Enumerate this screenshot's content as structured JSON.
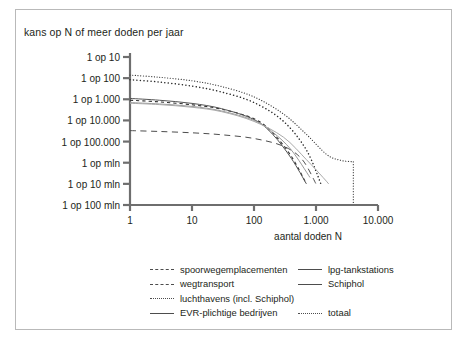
{
  "figure": {
    "title": "kans op N of meer doden per jaar",
    "frame_color": "#b9b9b9",
    "line_color": "#4d4d4d",
    "axis_color": "#6e6e6e"
  },
  "chart_data": {
    "type": "line",
    "title": "kans op N of meer doden per jaar",
    "xlabel": "aantal doden  N",
    "ylabel": "kans op N of meer doden per jaar",
    "xscale": "log",
    "yscale": "log",
    "xlim": [
      1,
      10000
    ],
    "ylim": [
      1e-08,
      0.1
    ],
    "grid": false,
    "legend_position": "below",
    "xticks": [
      1,
      10,
      100,
      1000,
      10000
    ],
    "xticklabels": [
      "1",
      "10",
      "100",
      "1.000",
      "10.000"
    ],
    "yticks": [
      0.1,
      0.01,
      0.001,
      0.0001,
      1e-05,
      1e-06,
      1e-07,
      1e-08
    ],
    "yticklabels": [
      "1 op 10",
      "1 op 100",
      "1 op 1.000",
      "1 op 10.000",
      "1 op 100.000",
      "1 op mln",
      "1 op 10 mln",
      "1 op 100 mln"
    ],
    "series": [
      {
        "name": "spoorwegemplacementen",
        "style": "longdash",
        "x": [
          1,
          3,
          10,
          30,
          100,
          300,
          600,
          1000
        ],
        "y": [
          3.3e-05,
          3e-05,
          2.6e-05,
          2.1e-05,
          1.4e-05,
          6e-06,
          1.4e-06,
          1e-07
        ]
      },
      {
        "name": "wegtransport",
        "style": "dash",
        "x": [
          1,
          3,
          10,
          30,
          100,
          200,
          400,
          700
        ],
        "y": [
          0.0009,
          0.00075,
          0.00055,
          0.00034,
          0.00012,
          2.6e-05,
          2e-06,
          1e-07
        ]
      },
      {
        "name": "luchthavens (incl. Schiphol)",
        "style": "dot",
        "x": [
          1,
          3,
          10,
          30,
          100,
          300,
          700,
          1200
        ],
        "y": [
          0.0085,
          0.0065,
          0.0042,
          0.0022,
          0.0007,
          9e-05,
          4e-06,
          1e-07
        ]
      },
      {
        "name": "EVR-plichtige bedrijven",
        "style": "solid",
        "x": [
          1,
          3,
          10,
          30,
          100,
          200,
          400,
          700
        ],
        "y": [
          0.0011,
          0.0009,
          0.00064,
          0.00036,
          0.00011,
          2.2e-05,
          1.6e-06,
          1e-07
        ]
      },
      {
        "name": "lpg-tankstations",
        "style": "solid-light",
        "x": [
          1,
          3,
          10,
          30,
          100,
          200,
          400,
          800
        ],
        "y": [
          0.0007,
          0.0006,
          0.00046,
          0.00028,
          0.0001,
          2.8e-05,
          4e-06,
          2e-07
        ]
      },
      {
        "name": "Schiphol",
        "style": "solid-light2",
        "x": [
          1,
          3,
          10,
          30,
          100,
          300,
          700,
          1300,
          1600
        ],
        "y": [
          0.00065,
          0.00056,
          0.00042,
          0.00026,
          9e-05,
          1.6e-05,
          1.4e-06,
          2e-07,
          1e-07
        ]
      },
      {
        "name": "totaal",
        "style": "fine-dot",
        "x": [
          1,
          3,
          10,
          30,
          100,
          300,
          700,
          1500,
          2500,
          4000,
          4000
        ],
        "y": [
          0.014,
          0.011,
          0.0075,
          0.004,
          0.0013,
          0.0002,
          2.2e-05,
          2.4e-06,
          1.3e-06,
          1.1e-06,
          1e-08
        ]
      }
    ]
  },
  "legend": {
    "rows": [
      [
        {
          "label": "spoorwegemplacementen",
          "style": "longdash"
        },
        {
          "label": "lpg-tankstations",
          "style": "solid"
        }
      ],
      [
        {
          "label": "wegtransport",
          "style": "dash"
        },
        {
          "label": "Schiphol",
          "style": "solid"
        }
      ],
      [
        {
          "label": "luchthavens (incl. Schiphol)",
          "style": "dot"
        },
        {
          "label": "",
          "style": ""
        }
      ],
      [
        {
          "label": "EVR-plichtige bedrijven",
          "style": "solid"
        },
        {
          "label": "totaal",
          "style": "fine"
        }
      ]
    ]
  }
}
